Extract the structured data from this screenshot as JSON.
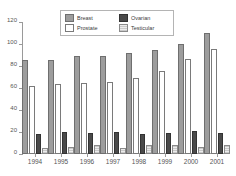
{
  "chart_data": {
    "type": "bar",
    "title": "",
    "xlabel": "",
    "ylabel": "",
    "ylim": [
      0,
      120
    ],
    "yticks": [
      0,
      20,
      40,
      60,
      80,
      100,
      120
    ],
    "grid": false,
    "legend_position": "top-center",
    "categories": [
      "1994",
      "1995",
      "1996",
      "1997",
      "1998",
      "1999",
      "2000",
      "2001"
    ],
    "series": [
      {
        "name": "Breast",
        "color": "#9d9d9d",
        "values": [
          84,
          84,
          87,
          87,
          90,
          93,
          98,
          108
        ]
      },
      {
        "name": "Prostate",
        "color": "#ffffff",
        "values": [
          60,
          62,
          63,
          64,
          67,
          74,
          85,
          94
        ]
      },
      {
        "name": "Ovarian",
        "color": "#4a4a4a",
        "values": [
          16,
          18,
          17,
          18,
          16,
          17,
          19,
          17
        ]
      },
      {
        "name": "Testicular",
        "color": "#d7d7d7",
        "values": [
          4,
          5,
          6,
          4,
          6,
          6,
          5,
          6
        ]
      }
    ]
  }
}
